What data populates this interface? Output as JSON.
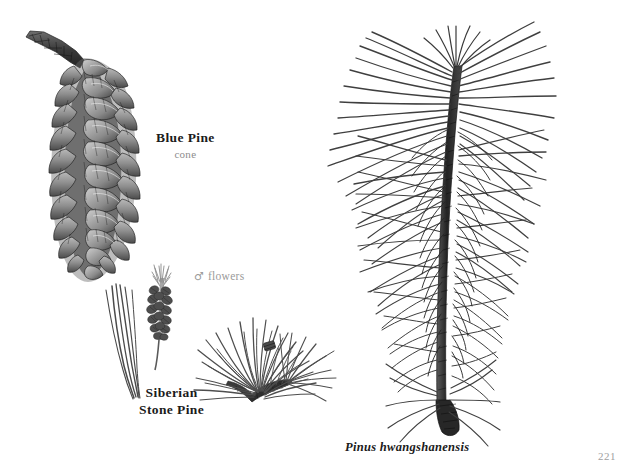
{
  "page": {
    "background_color": "#ffffff",
    "page_number": "221",
    "page_number_color": "#a0a0a0"
  },
  "captions": {
    "blue_pine": {
      "title": "Blue Pine",
      "subtitle": "cone",
      "title_color": "#1b1b1b",
      "subtitle_color": "#8d8d8d"
    },
    "male_flowers": {
      "symbol": "♂",
      "label": "flowers",
      "color": "#9a9a9a"
    },
    "siberian_stone_pine": {
      "line1": "Siberian",
      "line2": "Stone Pine",
      "color": "#1b1b1b"
    },
    "pinus_hwangshanensis": {
      "label": "Pinus hwangshanensis",
      "color": "#1b1b1b"
    }
  },
  "illustrations": [
    {
      "name": "blue-pine-cone",
      "description": "Long pendulous pine cone with woody curved stalk and overlapping reflexed scales, pen-and-ink botanical engraving",
      "ink_color": "#3a3a3a"
    },
    {
      "name": "siberian-stone-pine-needles",
      "description": "Slender detached needle bundle, pen-and-ink botanical engraving",
      "ink_color": "#4a4a4a"
    },
    {
      "name": "male-pollen-cones",
      "description": "Cluster of male pollen cones (staminate flowers) on short axis",
      "ink_color": "#555555"
    },
    {
      "name": "siberian-stone-pine-spray",
      "description": "Dense radiating tuft of needles on a short branch terminal",
      "ink_color": "#474747"
    },
    {
      "name": "pinus-hwangshanensis-branch",
      "description": "Large branch with long sweeping paired needles radiating from a dark central stem",
      "ink_color": "#3f3f3f"
    }
  ]
}
